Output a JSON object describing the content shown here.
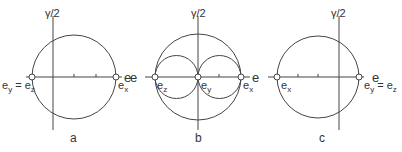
{
  "panels": [
    {
      "id": "a",
      "label": "a",
      "axis_y": "γ/2",
      "axis_x": "e",
      "left_point": "e",
      "left_point_sub": "y",
      "left_eq": " = e",
      "left_eq_sub": "z",
      "right_point": "e",
      "right_point_sub": "x"
    },
    {
      "id": "b",
      "label": "b",
      "axis_y": "γ/2",
      "axis_x": "e",
      "axis_x_left": "e",
      "p1": "e",
      "p1_sub": "z",
      "p2": "e",
      "p2_sub": "y",
      "p3": "e",
      "p3_sub": "x"
    },
    {
      "id": "c",
      "label": "c",
      "axis_y": "γ/2",
      "axis_x": "e",
      "left_point": "e",
      "left_point_sub": "x",
      "right_point": "e",
      "right_point_sub": "y",
      "right_eq": " = e",
      "right_eq_sub": "z"
    }
  ]
}
